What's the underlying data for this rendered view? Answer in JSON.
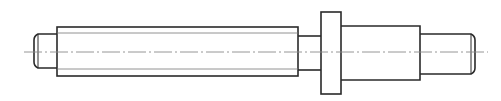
{
  "diagram": {
    "type": "technical-drawing",
    "colors": {
      "background": "#ffffff",
      "outline": "#2a2a2a",
      "centerline": "#8a8a8a"
    },
    "parts": [
      {
        "name": "left-stub",
        "x": 34,
        "y": 34,
        "w": 23,
        "h": 34,
        "chamfer": "left"
      },
      {
        "name": "main-shaft",
        "x": 57,
        "y": 27,
        "w": 241,
        "h": 49,
        "inner_lines": [
          33,
          69
        ]
      },
      {
        "name": "neck",
        "x": 298,
        "y": 36,
        "w": 23,
        "h": 34
      },
      {
        "name": "collar",
        "x": 321,
        "y": 12,
        "w": 20,
        "h": 82
      },
      {
        "name": "right-section",
        "x": 341,
        "y": 26,
        "w": 79,
        "h": 54
      },
      {
        "name": "right-stub",
        "x": 420,
        "y": 34,
        "w": 55,
        "h": 40,
        "chamfer": "right"
      }
    ],
    "centerline": {
      "y": 52,
      "x1": 24,
      "x2": 488
    }
  }
}
